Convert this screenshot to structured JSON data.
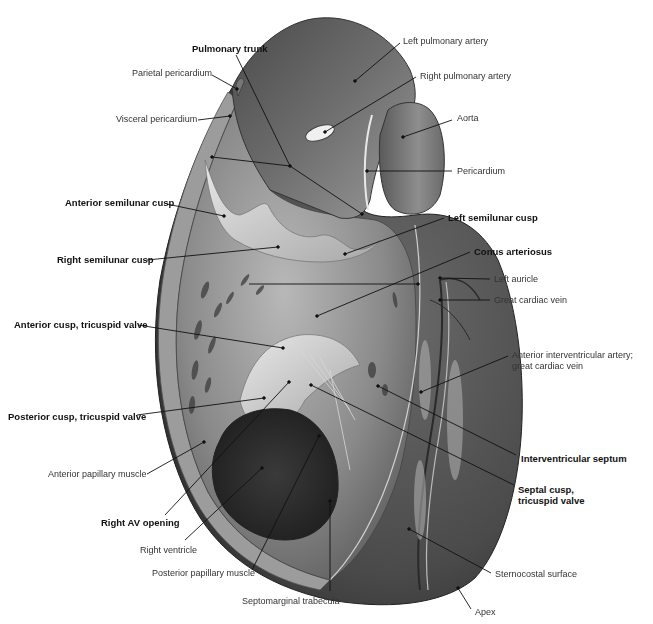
{
  "figure": {
    "colors": {
      "background": "#ffffff",
      "label_text": "#333333",
      "leader_line": "#111111",
      "tissue_dark": "#3a3a3a",
      "tissue_mid": "#7a7a7a",
      "tissue_light": "#c8c8c8"
    },
    "labels": [
      {
        "id": "pulmonary-trunk",
        "text": "Pulmonary trunk",
        "bold": true,
        "x": 192,
        "y": 43,
        "align": "left",
        "leaders": [
          [
            236,
            55,
            290,
            166
          ],
          [
            290,
            166,
            212,
            157
          ],
          [
            290,
            166,
            362,
            214
          ]
        ]
      },
      {
        "id": "parietal-pericardium",
        "text": "Parietal pericardium",
        "bold": false,
        "x": 132,
        "y": 68,
        "align": "left",
        "leaders": [
          [
            212,
            75,
            237,
            89
          ]
        ]
      },
      {
        "id": "visceral-pericardium",
        "text": "Visceral pericardium",
        "bold": false,
        "x": 116,
        "y": 114,
        "align": "left",
        "leaders": [
          [
            198,
            120,
            230,
            116
          ]
        ]
      },
      {
        "id": "left-pulmonary-artery",
        "text": "Left pulmonary artery",
        "bold": false,
        "x": 403,
        "y": 36,
        "align": "left",
        "leaders": [
          [
            400,
            43,
            355,
            81
          ]
        ]
      },
      {
        "id": "right-pulmonary-artery",
        "text": "Right pulmonary artery",
        "bold": false,
        "x": 420,
        "y": 71,
        "align": "left",
        "leaders": [
          [
            416,
            77,
            325,
            132
          ]
        ]
      },
      {
        "id": "aorta",
        "text": "Aorta",
        "bold": false,
        "x": 457,
        "y": 113,
        "align": "left",
        "leaders": [
          [
            452,
            120,
            403,
            137
          ]
        ]
      },
      {
        "id": "pericardium",
        "text": "Pericardium",
        "bold": false,
        "x": 457,
        "y": 166,
        "align": "left",
        "leaders": [
          [
            452,
            171,
            367,
            171
          ]
        ]
      },
      {
        "id": "anterior-semilunar-cusp",
        "text": "Anterior semilunar cusp",
        "bold": true,
        "x": 65,
        "y": 197,
        "align": "left",
        "leaders": [
          [
            167,
            204,
            224,
            216
          ]
        ]
      },
      {
        "id": "left-semilunar-cusp",
        "text": "Left semilunar cusp",
        "bold": true,
        "x": 448,
        "y": 212,
        "align": "left",
        "leaders": [
          [
            444,
            218,
            345,
            254
          ]
        ]
      },
      {
        "id": "right-semilunar-cusp",
        "text": "Right semilunar cusp",
        "bold": true,
        "x": 57,
        "y": 254,
        "align": "left",
        "leaders": [
          [
            147,
            260,
            278,
            247
          ]
        ]
      },
      {
        "id": "conus-arteriosus",
        "text": "Conus arteriosus",
        "bold": true,
        "x": 474,
        "y": 246,
        "align": "left",
        "leaders": [
          [
            470,
            252,
            317,
            316
          ]
        ]
      },
      {
        "id": "right-semilunar-line-extra",
        "text": "",
        "bold": false,
        "x": 0,
        "y": 0,
        "align": "left",
        "leaders": [
          [
            249,
            284,
            418,
            284
          ]
        ]
      },
      {
        "id": "left-auricle",
        "text": "Left auricle",
        "bold": false,
        "x": 494,
        "y": 274,
        "align": "left",
        "leaders": [
          [
            490,
            279,
            440,
            278
          ]
        ]
      },
      {
        "id": "great-cardiac-vein",
        "text": "Great cardiac vein",
        "bold": false,
        "x": 494,
        "y": 295,
        "align": "left",
        "leaders": [
          [
            490,
            300,
            440,
            300
          ]
        ]
      },
      {
        "id": "anterior-cusp-tricuspid-valve",
        "text": "Anterior cusp, tricuspid valve",
        "bold": true,
        "x": 14,
        "y": 319,
        "align": "left",
        "leaders": [
          [
            138,
            325,
            283,
            348
          ]
        ]
      },
      {
        "id": "anterior-interventricular-artery",
        "text": "Anterior interventricular artery;\ngreat cardiac vein",
        "bold": false,
        "x": 512,
        "y": 350,
        "align": "left",
        "multi": true,
        "leaders": [
          [
            508,
            356,
            421,
            392
          ]
        ]
      },
      {
        "id": "posterior-cusp-tricuspid-valve",
        "text": "Posterior cusp, tricuspid valve",
        "bold": true,
        "x": 8,
        "y": 411,
        "align": "left",
        "leaders": [
          [
            137,
            415,
            264,
            398
          ]
        ]
      },
      {
        "id": "interventricular-septum",
        "text": "Interventricular septum",
        "bold": true,
        "x": 521,
        "y": 453,
        "align": "left",
        "leaders": [
          [
            516,
            455,
            378,
            386
          ]
        ]
      },
      {
        "id": "septal-cusp-tricuspid-valve",
        "text": "Septal cusp,\ntricuspid valve",
        "bold": true,
        "x": 518,
        "y": 484,
        "align": "left",
        "multi": true,
        "leaders": [
          [
            514,
            485,
            311,
            385
          ]
        ]
      },
      {
        "id": "anterior-papillary-muscle",
        "text": "Anterior papillary muscle",
        "bold": false,
        "x": 48,
        "y": 469,
        "align": "left",
        "leaders": [
          [
            147,
            474,
            204,
            442
          ]
        ]
      },
      {
        "id": "right-av-opening",
        "text": "Right AV opening",
        "bold": true,
        "x": 101,
        "y": 517,
        "align": "left",
        "leaders": [
          [
            165,
            515,
            289,
            382
          ]
        ]
      },
      {
        "id": "right-ventricle",
        "text": "Right ventricle",
        "bold": false,
        "x": 140,
        "y": 545,
        "align": "left",
        "leaders": [
          [
            185,
            540,
            262,
            468
          ]
        ]
      },
      {
        "id": "posterior-papillary-muscle",
        "text": "Posterior papillary muscle",
        "bold": false,
        "x": 152,
        "y": 568,
        "align": "left",
        "leaders": [
          [
            252,
            570,
            319,
            436
          ]
        ]
      },
      {
        "id": "septomarginal-trabecula",
        "text": "Septomarginal trabecula",
        "bold": false,
        "x": 242,
        "y": 596,
        "align": "left",
        "leaders": [
          [
            330,
            591,
            330,
            501
          ]
        ]
      },
      {
        "id": "sternocostal-surface",
        "text": "Sternocostal surface",
        "bold": false,
        "x": 495,
        "y": 569,
        "align": "left",
        "leaders": [
          [
            491,
            573,
            409,
            529
          ]
        ]
      },
      {
        "id": "apex",
        "text": "Apex",
        "bold": false,
        "x": 475,
        "y": 607,
        "align": "left",
        "leaders": [
          [
            471,
            609,
            458,
            588
          ]
        ]
      }
    ]
  }
}
